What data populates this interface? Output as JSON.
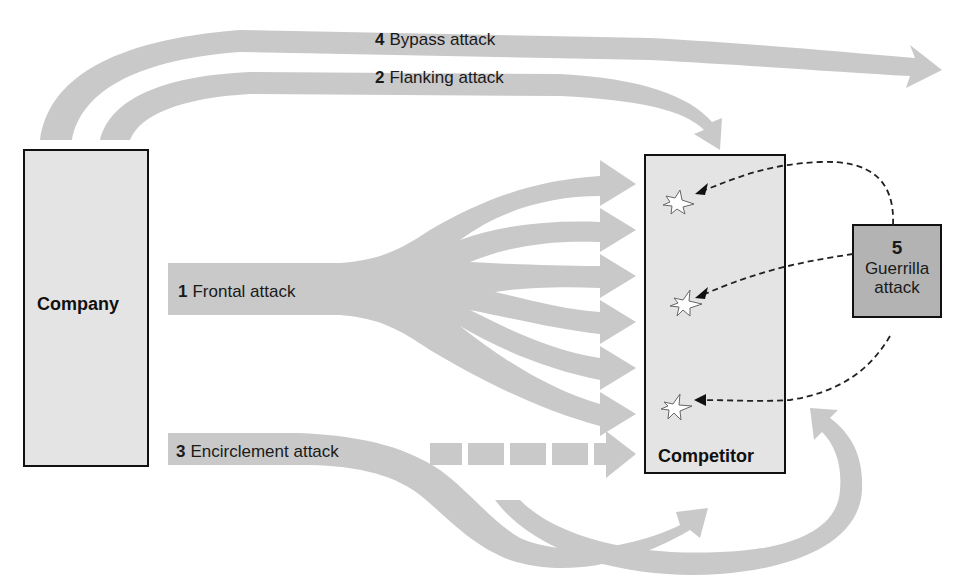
{
  "colors": {
    "arrow_fill": "#c9c9c9",
    "box_fill": "#e4e4e4",
    "guerrilla_fill": "#b3b3b3",
    "border": "#111111",
    "text": "#1a1a1a"
  },
  "nodes": {
    "company": {
      "label": "Company"
    },
    "competitor": {
      "label": "Competitor"
    },
    "guerrilla": {
      "number": "5",
      "line1": "Guerrilla",
      "line2": "attack"
    }
  },
  "attacks": [
    {
      "id": "frontal",
      "number": "1",
      "name": "Frontal attack"
    },
    {
      "id": "flanking",
      "number": "2",
      "name": "Flanking attack"
    },
    {
      "id": "encirclement",
      "number": "3",
      "name": "Encirclement attack"
    },
    {
      "id": "bypass",
      "number": "4",
      "name": "Bypass attack"
    },
    {
      "id": "guerrilla",
      "number": "5",
      "name": "Guerrilla attack"
    }
  ],
  "icons": {
    "explosion": "explosion-icon",
    "arrow": "arrow-icon"
  }
}
